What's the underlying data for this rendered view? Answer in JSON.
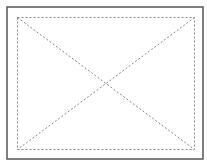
{
  "placeholder": {
    "kind": "image-placeholder",
    "icon": "crossed-box-icon",
    "colors": {
      "background": "#ffffff",
      "outer_border": "#555555",
      "dashed_lines": "#888888"
    }
  }
}
